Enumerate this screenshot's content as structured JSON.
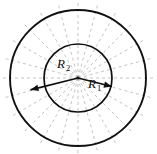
{
  "figure": {
    "background_color": "#ffffff",
    "stroke_color": "#111111",
    "dashed_color": "#b9b9b9",
    "center": {
      "x": 78,
      "y": 78
    },
    "circles": [
      {
        "name": "inner-circle",
        "radius": 34,
        "stroke_width": 1.7
      },
      {
        "name": "outer-circle",
        "radius": 68,
        "stroke_width": 1.9
      }
    ],
    "radial_lines": {
      "count": 24,
      "style": "dashed",
      "dash_pattern": "3 3",
      "start_angle_deg": 0,
      "length": 78
    },
    "arrows": [
      {
        "name": "r1-arrow",
        "label": "R",
        "subscript": "1",
        "angle_deg": -14,
        "length": 35,
        "label_x": 88,
        "label_y": 88,
        "sub_x": 97,
        "sub_y": 91
      },
      {
        "name": "r2-arrow",
        "label": "R",
        "subscript": "2",
        "angle_deg": 194,
        "length": 49,
        "label_x": 57,
        "label_y": 68,
        "sub_x": 66,
        "sub_y": 71
      }
    ]
  }
}
